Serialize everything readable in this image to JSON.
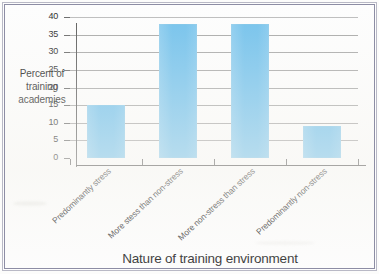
{
  "chart_data": {
    "type": "bar",
    "title": "",
    "subtitle": "",
    "xlabel": "Nature of training environment",
    "ylabel": "Percent of training academies",
    "ylabel_lines": [
      "Percent of",
      "training",
      "academies"
    ],
    "categories": [
      "Predominantly stress",
      "More stess than non-stress",
      "More non-stress than stress",
      "Predominantly non-stress"
    ],
    "values": [
      15,
      38,
      38,
      9
    ],
    "ylim": [
      0,
      40
    ],
    "ytick_labels": [
      "0",
      "5",
      "10",
      "15",
      "20",
      "25",
      "30",
      "35",
      "40"
    ],
    "ytick_values": [
      0,
      5,
      10,
      15,
      20,
      25,
      30,
      35,
      40
    ],
    "grid": "horizontal",
    "legend": "none",
    "bar_color": "#74c2ec",
    "axis_color": "#4a4a4a",
    "grid_color": "#a9a9a9",
    "frame_color": "#8d8da4",
    "background_color": "#fdfdfd"
  }
}
